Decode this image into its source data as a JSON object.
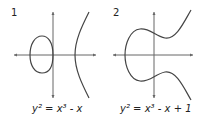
{
  "panels": [
    {
      "number": "1",
      "equation": "y² = x³ - x"
    },
    {
      "number": "2",
      "equation": "y² = x³ - x + 1"
    }
  ],
  "colors": {
    "axis": "#555555",
    "curve": "#444444",
    "text": "#222222"
  }
}
